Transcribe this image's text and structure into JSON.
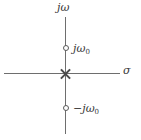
{
  "figure": {
    "axes": {
      "vertical_label": "jω",
      "horizontal_label": "σ"
    },
    "markers": [
      {
        "name": "zero-upper",
        "glyph": "circle-marker",
        "label_main": "jω",
        "label_sub": "0",
        "meaning": "zero"
      },
      {
        "name": "pole-origin",
        "glyph": "cross-marker",
        "label_main": "",
        "label_sub": "",
        "meaning": "double pole at origin"
      },
      {
        "name": "zero-lower",
        "glyph": "circle-marker",
        "label_main": "−jω",
        "label_sub": "0",
        "meaning": "zero"
      }
    ],
    "colors": {
      "axis": "#6e6e6e",
      "marker": "#5a5a5a",
      "text": "#3a3a3a",
      "background": "#ffffff"
    }
  },
  "chart_data": {
    "type": "scatter",
    "title": "",
    "xlabel": "σ",
    "ylabel": "jω",
    "xlim": [
      -1.1,
      1.1
    ],
    "ylim": [
      -1.3,
      1.3
    ],
    "grid": false,
    "legend": null,
    "series": [
      {
        "name": "zeros",
        "marker": "o",
        "points": [
          {
            "x": 0,
            "y": 1,
            "label": "jω₀"
          },
          {
            "x": 0,
            "y": -1,
            "label": "−jω₀"
          }
        ]
      },
      {
        "name": "poles",
        "marker": "x",
        "points": [
          {
            "x": 0,
            "y": 0,
            "label": ""
          }
        ]
      }
    ],
    "annotations": [
      "jω",
      "σ",
      "jω₀",
      "−jω₀"
    ]
  }
}
